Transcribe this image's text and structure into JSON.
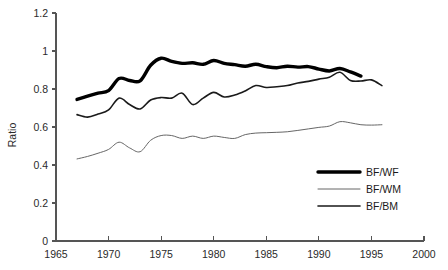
{
  "chart_data": {
    "type": "line",
    "title": "",
    "subtitle": "",
    "xlabel": "",
    "ylabel": "Ratio",
    "xlim": [
      1965,
      2000
    ],
    "ylim": [
      0,
      1.2
    ],
    "grid": false,
    "legend_position": "bottom-right",
    "x_ticks": [
      1965,
      1970,
      1975,
      1980,
      1985,
      1990,
      1995,
      2000
    ],
    "x_tick_labels": [
      "1965",
      "1970",
      "1975",
      "1980",
      "1985",
      "1990",
      "1995",
      "2000"
    ],
    "y_ticks": [
      0,
      0.2,
      0.4,
      0.6,
      0.8,
      1,
      1.2
    ],
    "y_tick_labels": [
      "0",
      "0.2",
      "0.4",
      "0.6",
      "0.8",
      "1",
      "1.2"
    ],
    "series": [
      {
        "name": "BF/WF",
        "color": "#000000",
        "line_width": 3.4,
        "x": [
          1967,
          1968,
          1969,
          1970,
          1971,
          1972,
          1973,
          1974,
          1975,
          1976,
          1977,
          1978,
          1979,
          1980,
          1981,
          1982,
          1983,
          1984,
          1985,
          1986,
          1987,
          1988,
          1989,
          1990,
          1991,
          1992,
          1993,
          1994
        ],
        "values": [
          0.745,
          0.762,
          0.778,
          0.792,
          0.855,
          0.845,
          0.843,
          0.925,
          0.962,
          0.945,
          0.935,
          0.938,
          0.93,
          0.95,
          0.935,
          0.928,
          0.92,
          0.93,
          0.918,
          0.912,
          0.92,
          0.915,
          0.918,
          0.905,
          0.895,
          0.908,
          0.89,
          0.868
        ]
      },
      {
        "name": "BF/WM",
        "color": "#666666",
        "line_width": 1.0,
        "x": [
          1967,
          1968,
          1969,
          1970,
          1971,
          1972,
          1973,
          1974,
          1975,
          1976,
          1977,
          1978,
          1979,
          1980,
          1981,
          1982,
          1983,
          1984,
          1985,
          1986,
          1987,
          1988,
          1989,
          1990,
          1991,
          1992,
          1993,
          1994,
          1995,
          1996
        ],
        "values": [
          0.432,
          0.445,
          0.462,
          0.482,
          0.52,
          0.49,
          0.47,
          0.53,
          0.555,
          0.555,
          0.54,
          0.552,
          0.54,
          0.552,
          0.545,
          0.54,
          0.56,
          0.568,
          0.57,
          0.572,
          0.575,
          0.582,
          0.59,
          0.598,
          0.605,
          0.628,
          0.622,
          0.612,
          0.61,
          0.612
        ]
      },
      {
        "name": "BF/BM",
        "color": "#1a1a1a",
        "line_width": 1.6,
        "x": [
          1967,
          1968,
          1969,
          1970,
          1971,
          1972,
          1973,
          1974,
          1975,
          1976,
          1977,
          1978,
          1979,
          1980,
          1981,
          1982,
          1983,
          1984,
          1985,
          1986,
          1987,
          1988,
          1989,
          1990,
          1991,
          1992,
          1993,
          1994,
          1995,
          1996
        ],
        "values": [
          0.665,
          0.652,
          0.668,
          0.69,
          0.752,
          0.718,
          0.695,
          0.742,
          0.755,
          0.752,
          0.778,
          0.718,
          0.752,
          0.782,
          0.758,
          0.768,
          0.79,
          0.818,
          0.808,
          0.812,
          0.818,
          0.832,
          0.84,
          0.852,
          0.862,
          0.888,
          0.845,
          0.842,
          0.848,
          0.818
        ]
      }
    ]
  },
  "legend": {
    "items": [
      {
        "label": "BF/WF"
      },
      {
        "label": "BF/WM"
      },
      {
        "label": "BF/BM"
      }
    ]
  }
}
